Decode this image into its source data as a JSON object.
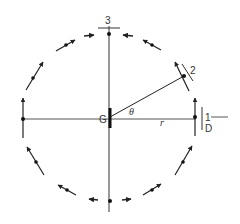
{
  "diagram": {
    "type": "rotating-body-positions",
    "center_label": "G",
    "angle_label": "θ",
    "radius_label": "r",
    "positions": [
      {
        "id": "1",
        "label": "1",
        "sublabel": "D"
      },
      {
        "id": "2",
        "label": "2"
      },
      {
        "id": "3",
        "label": "3"
      }
    ],
    "flow_direction": "from bottom up both sides toward top",
    "colors": {
      "line": "#222222",
      "text": "#333333",
      "background": "#ffffff"
    }
  }
}
